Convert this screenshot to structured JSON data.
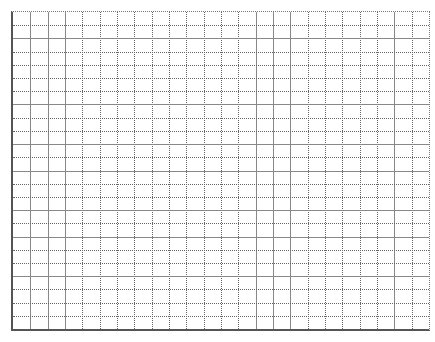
{
  "chart_data": {
    "type": "line",
    "title": "",
    "xlabel": "",
    "ylabel": "",
    "grid": true,
    "grid_columns": 24,
    "grid_rows": 24,
    "series": [],
    "legend": null
  },
  "style": {
    "line_color": "#666666",
    "border_color": "#555555",
    "background": "#ffffff"
  },
  "caption": ""
}
